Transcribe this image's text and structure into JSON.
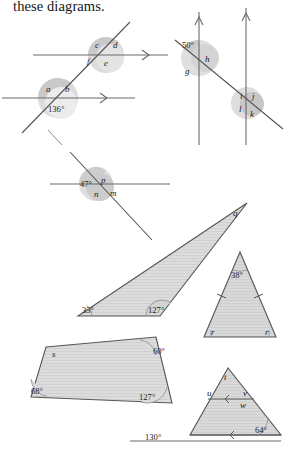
{
  "page": {
    "heading": "these diagrams.",
    "width": 290,
    "height": 450,
    "background": "#ffffff",
    "ink": "#4d4d4d",
    "label_color": "#1c1c1c"
  },
  "style": {
    "shape_fill": "#d8d8d8",
    "shape_stroke": "#555555",
    "arc_fill": "#cfcfcf",
    "arc_fill_light": "#e2e2e2",
    "arc_stroke": "#8c8c8c",
    "line_color": "#6a6a6a"
  },
  "diagrams": [
    {
      "id": "parallel-lines-transversal-abcdef",
      "name": "two-parallel-lines-cut-by-transversal",
      "labels": {
        "upper_intersection": [
          {
            "key": "c",
            "text": "c",
            "position": "top-left"
          },
          {
            "key": "d",
            "text": "d",
            "position": "top-right"
          },
          {
            "key": "f",
            "text": "f",
            "position": "bottom-left"
          },
          {
            "key": "e",
            "text": "e",
            "position": "bottom-right"
          }
        ],
        "lower_intersection": [
          {
            "key": "a",
            "text": "a",
            "position": "top-left"
          },
          {
            "key": "b",
            "text": "b",
            "position": "top-right"
          },
          {
            "key": "given",
            "text": "136°",
            "position": "bottom"
          }
        ]
      },
      "arrow_marks": 2
    },
    {
      "id": "parallel-lines-transversal-ghijkl",
      "name": "two-vertical-parallel-lines-cut-by-transversal",
      "labels": {
        "upper_intersection": [
          {
            "key": "given",
            "text": "50°",
            "position": "top-left"
          },
          {
            "key": "h",
            "text": "h",
            "position": "top-right"
          },
          {
            "key": "g",
            "text": "g",
            "position": "bottom-left"
          }
        ],
        "lower_intersection": [
          {
            "key": "i",
            "text": "i",
            "position": "top-left"
          },
          {
            "key": "j",
            "text": "j",
            "position": "top-right"
          },
          {
            "key": "l",
            "text": "l",
            "position": "bottom-left"
          },
          {
            "key": "k",
            "text": "k",
            "position": "bottom-right"
          }
        ]
      },
      "arrow_marks": 2
    },
    {
      "id": "single-intersection-mnp",
      "name": "line-crossed-by-transversal",
      "labels": [
        {
          "key": "given",
          "text": "47°",
          "position": "top-left"
        },
        {
          "key": "p",
          "text": "p",
          "position": "top-right"
        },
        {
          "key": "n",
          "text": "n",
          "position": "bottom-left"
        },
        {
          "key": "m",
          "text": "m",
          "position": "bottom-right"
        }
      ]
    },
    {
      "id": "large-triangle-q",
      "name": "large-thin-triangle",
      "labels": [
        {
          "key": "given",
          "text": "33°",
          "position": "bottom-left-vertex"
        },
        {
          "key": "given2",
          "text": "127°",
          "position": "bottom-right-vertex"
        },
        {
          "key": "q",
          "text": "q",
          "position": "apex-right"
        }
      ]
    },
    {
      "id": "isosceles-triangle-r",
      "name": "isosceles-triangle",
      "labels": [
        {
          "key": "given",
          "text": "38°",
          "position": "apex"
        },
        {
          "key": "r1",
          "text": "r",
          "position": "base-left"
        },
        {
          "key": "r2",
          "text": "r",
          "position": "base-right"
        }
      ],
      "tick_marks": 2
    },
    {
      "id": "parallelogram-s",
      "name": "quadrilateral-parallelogram",
      "labels": [
        {
          "key": "s",
          "text": "s",
          "position": "top-left"
        },
        {
          "key": "given",
          "text": "60°",
          "position": "top-right"
        },
        {
          "key": "given2",
          "text": "68°",
          "position": "bottom-left"
        },
        {
          "key": "given3",
          "text": "127°",
          "position": "bottom-right"
        }
      ]
    },
    {
      "id": "triangle-tuvw",
      "name": "triangle-with-interior-parallel-line",
      "labels": [
        {
          "key": "t",
          "text": "t",
          "position": "apex"
        },
        {
          "key": "u",
          "text": "u",
          "position": "inner-left"
        },
        {
          "key": "v",
          "text": "v",
          "position": "inner-right"
        },
        {
          "key": "w",
          "text": "w",
          "position": "below-inner-right"
        },
        {
          "key": "given",
          "text": "130°",
          "position": "exterior-bottom-left"
        },
        {
          "key": "given2",
          "text": "64°",
          "position": "bottom-right"
        }
      ],
      "arrow_marks": 2
    }
  ]
}
